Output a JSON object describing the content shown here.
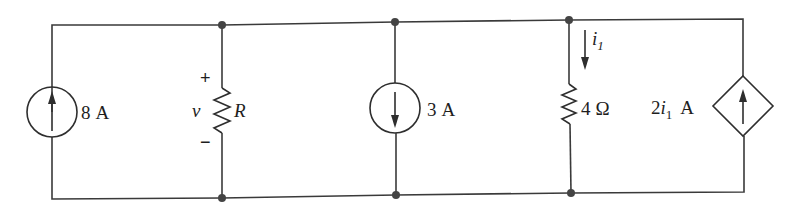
{
  "diagram": {
    "type": "circuit",
    "components": {
      "source_left": {
        "kind": "independent-current-source",
        "value": "8",
        "unit": "A",
        "direction": "up"
      },
      "resistor_r": {
        "kind": "resistor",
        "name": "R",
        "voltage_label": "v",
        "plus": "+",
        "minus": "−"
      },
      "source_mid": {
        "kind": "independent-current-source",
        "value": "3",
        "unit": "A",
        "direction": "down"
      },
      "resistor_4": {
        "kind": "resistor",
        "value": "4",
        "unit": "Ω",
        "current_label": "i",
        "current_sub": "1",
        "current_direction": "down"
      },
      "source_dep": {
        "kind": "dependent-current-source",
        "coef": "2",
        "var": "i",
        "var_sub": "1",
        "unit": "A",
        "direction": "up"
      }
    },
    "colors": {
      "wire": "#3a3a3a",
      "node": "#444444",
      "text": "#1e1e1e"
    }
  }
}
